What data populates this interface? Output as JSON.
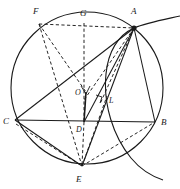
{
  "figure": {
    "background_color": "#ffffff",
    "stroke_color": "#1a1a1a",
    "width": 180,
    "height": 189
  },
  "labels": {
    "A": "A",
    "B": "B",
    "C": "C",
    "D": "D",
    "E": "E",
    "F": "F",
    "G": "G",
    "L": "L",
    "O": "O"
  },
  "points": {
    "A": {
      "name": "A",
      "x": 134,
      "y": 28
    },
    "B": {
      "name": "B",
      "x": 155,
      "y": 122
    },
    "C": {
      "name": "C",
      "x": 15,
      "y": 120
    },
    "D": {
      "name": "D",
      "x": 84,
      "y": 122
    },
    "E": {
      "name": "E",
      "x": 82,
      "y": 166
    },
    "F": {
      "name": "F",
      "x": 39,
      "y": 24
    },
    "G": {
      "name": "G",
      "x": 84,
      "y": 23
    },
    "L": {
      "name": "L",
      "x": 104,
      "y": 98
    },
    "O": {
      "name": "O",
      "x": 86,
      "y": 92
    }
  },
  "label_positions": {
    "A": {
      "x": 133,
      "y": 14
    },
    "B": {
      "x": 162,
      "y": 124
    },
    "C": {
      "x": 5,
      "y": 124
    },
    "D": {
      "x": 78,
      "y": 131
    },
    "E": {
      "x": 77,
      "y": 181
    },
    "F": {
      "x": 33,
      "y": 14
    },
    "G": {
      "x": 81,
      "y": 16
    },
    "L": {
      "x": 110,
      "y": 101
    },
    "O": {
      "x": 76,
      "y": 93
    }
  },
  "circle": {
    "name": "main-circumscribed-circle",
    "center_x": 87,
    "center_y": 88,
    "radius": 76,
    "style": "solid"
  },
  "secondary_arc": {
    "name": "secondary-arc-through-A",
    "description": "Large arc entering top-right, passing through A and descending past B to lower right",
    "style": "solid"
  },
  "solid_segments": [
    {
      "name": "segment-C-B",
      "from": "C",
      "to": "B"
    },
    {
      "name": "segment-C-A",
      "from": "C",
      "to": "A"
    },
    {
      "name": "segment-A-B",
      "from": "A",
      "to": "B"
    },
    {
      "name": "segment-A-D",
      "from": "A",
      "to": "D"
    },
    {
      "name": "segment-A-E",
      "from": "A",
      "to": "E"
    },
    {
      "name": "segment-O-D",
      "from": "O",
      "to": "D"
    },
    {
      "name": "segment-C-E",
      "from": "C",
      "to": "E"
    }
  ],
  "dashed_segments": [
    {
      "name": "segment-F-A",
      "from": "F",
      "to": "A"
    },
    {
      "name": "segment-F-G",
      "from": "F",
      "to": "G"
    },
    {
      "name": "segment-G-D",
      "from": "G",
      "to": "D"
    },
    {
      "name": "segment-F-E",
      "from": "F",
      "to": "E"
    },
    {
      "name": "segment-F-D",
      "from": "F",
      "to": "D"
    },
    {
      "name": "segment-A-L",
      "from": "A",
      "to": "L"
    },
    {
      "name": "segment-A-O",
      "from": "A",
      "to": "O"
    },
    {
      "name": "segment-D-E",
      "from": "D",
      "to": "E"
    },
    {
      "name": "segment-E-B",
      "from": "E",
      "to": "B"
    },
    {
      "name": "segment-C-E-dashed",
      "from": "C",
      "to": "E"
    },
    {
      "name": "segment-E-L",
      "from": "E",
      "to": "L"
    }
  ],
  "markers": {
    "right_angle_at_L": {
      "name": "right-angle-mark-L",
      "visible": true
    },
    "arrow_O_to_D": {
      "name": "arrow-O-to-D",
      "visible": true
    },
    "vertex_dot_A": {
      "name": "vertex-dot-A",
      "visible": true
    }
  }
}
